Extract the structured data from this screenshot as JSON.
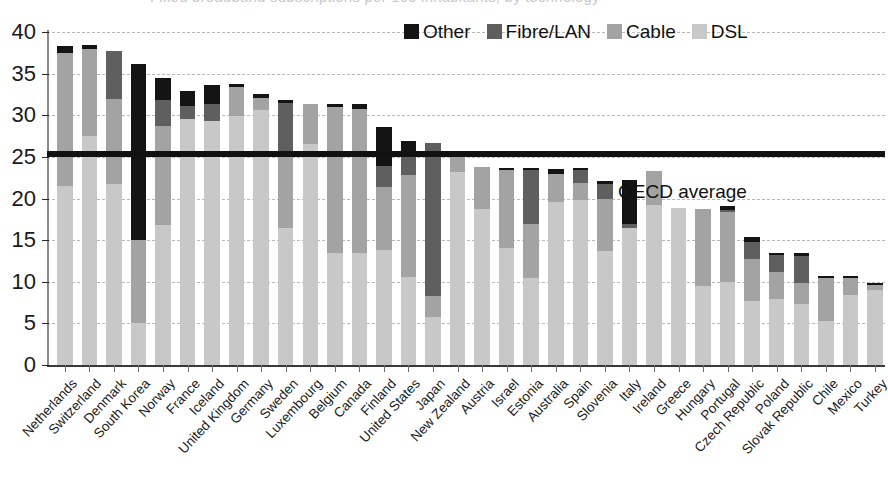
{
  "figure": {
    "faint_title": "Fixed broadband subscriptions per 100 inhabitants, by technology",
    "oecd_average_label": "OECD average"
  },
  "legend": {
    "position": "top-center",
    "items": [
      {
        "label": "Other",
        "color": "#141414",
        "key": "other"
      },
      {
        "label": "Fibre/LAN",
        "color": "#5f5f5f",
        "key": "fibre"
      },
      {
        "label": "Cable",
        "color": "#a3a3a3",
        "key": "cable"
      },
      {
        "label": "DSL",
        "color": "#c8c8c8",
        "key": "dsl"
      }
    ]
  },
  "axes": {
    "y_ticks": [
      0,
      5,
      10,
      15,
      20,
      25,
      30,
      35,
      40
    ],
    "y_min": 0,
    "y_max": 40,
    "grid": true
  },
  "chart_data": {
    "type": "bar",
    "stacked": true,
    "title": "Fixed broadband subscriptions per 100 inhabitants, by technology",
    "xlabel": "",
    "ylabel": "",
    "ylim": [
      0,
      40
    ],
    "ytick_step": 5,
    "grid": true,
    "legend_position": "top-center",
    "series_order": [
      "DSL",
      "Cable",
      "Fibre/LAN",
      "Other"
    ],
    "annotations": [
      {
        "text": "OECD average",
        "type": "hline",
        "value": 25.4
      }
    ],
    "categories": [
      "Netherlands",
      "Switzerland",
      "Denmark",
      "South Korea",
      "Norway",
      "France",
      "Iceland",
      "United Kingdom",
      "Germany",
      "Sweden",
      "Luxembourg",
      "Belgium",
      "Canada",
      "Finland",
      "United States",
      "Japan",
      "New Zealand",
      "Austria",
      "Israel",
      "Estonia",
      "Australia",
      "Spain",
      "Slovenia",
      "Italy",
      "Ireland",
      "Greece",
      "Hungary",
      "Portugal",
      "Czech Republic",
      "Poland",
      "Slovak Republic",
      "Chile",
      "Mexico",
      "Turkey"
    ],
    "series": [
      {
        "name": "DSL",
        "color": "#c8c8c8",
        "values": [
          21.5,
          27.5,
          21.7,
          5.0,
          16.8,
          29.5,
          29.3,
          29.9,
          30.6,
          16.4,
          26.6,
          13.4,
          13.4,
          13.8,
          10.6,
          5.8,
          23.2,
          18.8,
          14.0,
          10.4,
          19.6,
          19.8,
          13.7,
          16.5,
          19.2,
          18.9,
          9.5,
          10.0,
          7.7,
          7.9,
          7.3,
          5.3,
          8.4,
          9.0
        ]
      },
      {
        "name": "Cable",
        "color": "#a3a3a3",
        "values": [
          16.0,
          10.5,
          10.3,
          10.0,
          11.9,
          0.0,
          0.0,
          3.5,
          1.5,
          9.1,
          4.7,
          17.6,
          17.4,
          7.6,
          12.2,
          2.5,
          2.2,
          5.0,
          9.4,
          6.5,
          3.4,
          2.1,
          6.2,
          0.0,
          4.1,
          0.0,
          9.2,
          8.4,
          5.0,
          3.3,
          2.5,
          5.1,
          2.0,
          0.6
        ]
      },
      {
        "name": "Fibre/LAN",
        "color": "#5f5f5f",
        "values": [
          0.0,
          0.0,
          5.7,
          0.0,
          3.1,
          1.6,
          2.0,
          0.0,
          0.0,
          6.0,
          0.0,
          0.0,
          0.0,
          2.5,
          2.3,
          18.4,
          0.0,
          0.0,
          0.0,
          6.5,
          0.0,
          1.5,
          1.8,
          0.4,
          0.0,
          0.0,
          0.0,
          0.2,
          2.1,
          2.0,
          3.3,
          0.0,
          0.0,
          0.0
        ]
      },
      {
        "name": "Other",
        "color": "#141414",
        "values": [
          0.8,
          0.4,
          0.0,
          21.2,
          2.7,
          1.8,
          2.3,
          0.3,
          0.4,
          0.3,
          0.0,
          0.4,
          0.5,
          4.7,
          1.8,
          0.0,
          0.2,
          0.0,
          0.3,
          0.3,
          0.5,
          0.3,
          0.4,
          5.3,
          0.0,
          0.0,
          0.1,
          0.5,
          0.6,
          0.2,
          0.3,
          0.3,
          0.3,
          0.2
        ]
      }
    ],
    "totals": [
      38.3,
      38.4,
      37.7,
      36.2,
      34.5,
      32.9,
      33.6,
      33.7,
      32.5,
      31.8,
      31.3,
      31.4,
      31.3,
      28.6,
      26.9,
      26.7,
      25.6,
      23.8,
      23.7,
      23.7,
      23.5,
      23.7,
      22.1,
      22.2,
      23.3,
      18.9,
      18.8,
      19.1,
      15.4,
      13.4,
      13.4,
      10.7,
      10.7,
      9.8
    ]
  }
}
